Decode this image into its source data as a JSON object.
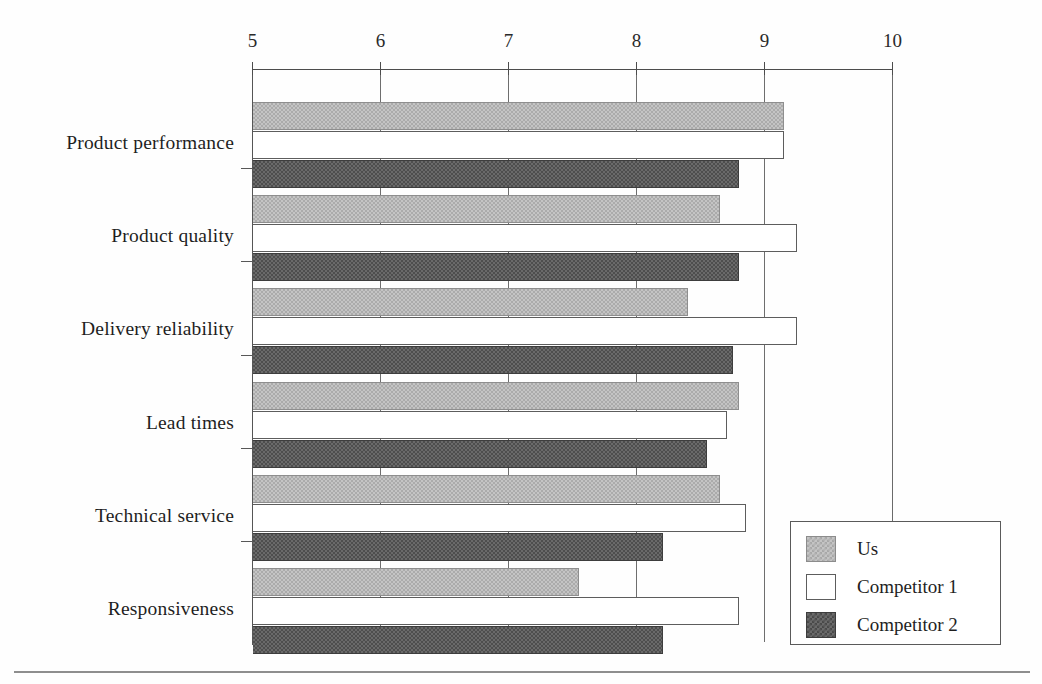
{
  "chart_data": {
    "type": "bar",
    "orientation": "horizontal",
    "title": "",
    "subtitle": "",
    "xlabel": "",
    "ylabel": "",
    "xlim": [
      5,
      10
    ],
    "xticks": [
      5,
      6,
      7,
      8,
      9,
      10
    ],
    "xtick_labels": [
      "5",
      "6",
      "7",
      "8",
      "9",
      "10"
    ],
    "grid": "vertical",
    "legend_position": "bottom-right",
    "categories": [
      "Product performance",
      "Product quality",
      "Delivery reliability",
      "Lead times",
      "Technical service",
      "Responsiveness"
    ],
    "series": [
      {
        "name": "Us",
        "color": "#c4c4c4",
        "values": [
          9.15,
          8.65,
          8.4,
          8.8,
          8.65,
          7.55
        ]
      },
      {
        "name": "Competitor 1",
        "color": "#ffffff",
        "values": [
          9.15,
          9.25,
          9.25,
          8.7,
          8.85,
          8.8
        ]
      },
      {
        "name": "Competitor 2",
        "color": "#6a6a6a",
        "values": [
          8.8,
          8.8,
          8.75,
          8.55,
          8.2,
          8.2
        ]
      }
    ]
  },
  "legend": {
    "entries": [
      {
        "label": "Us",
        "swatch": "us"
      },
      {
        "label": "Competitor 1",
        "swatch": "c1"
      },
      {
        "label": "Competitor 2",
        "swatch": "c2"
      }
    ]
  }
}
